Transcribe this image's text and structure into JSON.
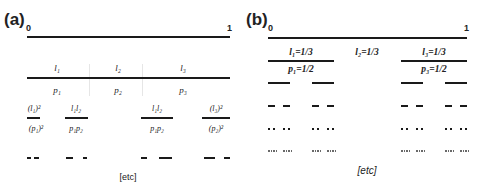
{
  "panel_a": {
    "label": "(a)",
    "start": "0",
    "end": "1",
    "level1": {
      "labels_top": [
        "l₁",
        "l₂",
        "l₃"
      ],
      "labels_bottom": [
        "p₁",
        "p₂",
        "p₃"
      ]
    },
    "level2": {
      "labels_top": [
        "(l₁)²",
        "l₁l₂",
        "l₁l₂",
        "(l₃)²"
      ],
      "labels_bottom": [
        "(p₁)²",
        "p₁p₂",
        "p₁p₂",
        "(p₂)²"
      ]
    },
    "etc": "[etc]"
  },
  "panel_b": {
    "label": "(b)",
    "start": "0",
    "end": "1",
    "level1": {
      "labels_top": [
        "l₁=1/3",
        "l₂=1/3",
        "l₃=1/3"
      ],
      "labels_bottom": [
        "p₁=1/2",
        "p₃=1/2"
      ]
    },
    "etc": "[etc]"
  }
}
